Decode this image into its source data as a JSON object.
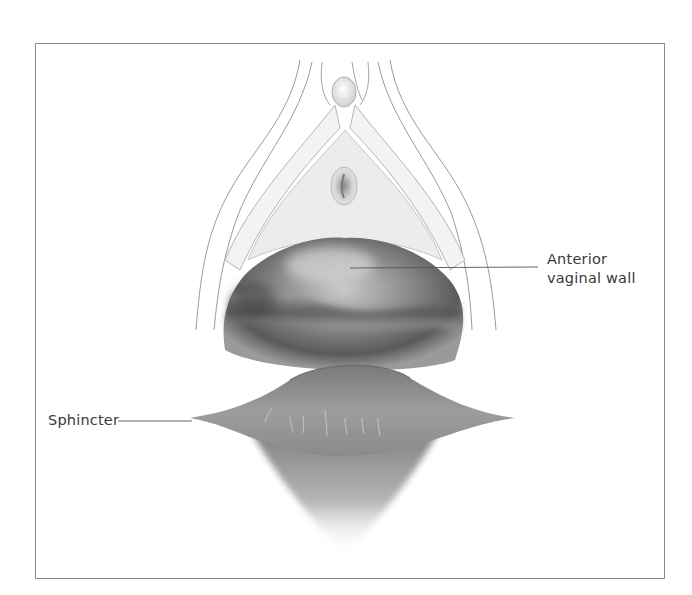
{
  "figure": {
    "type": "anatomical-illustration",
    "labels": {
      "anterior_line1": "Anterior",
      "anterior_line2": "vaginal wall",
      "sphincter": "Sphincter"
    },
    "colors": {
      "frame_border": "#8a8a8a",
      "label_text": "#3a3a3a",
      "leader_line": "#555555",
      "tissue_light": "#eeeeee",
      "tissue_dark": "#4a4a4a"
    }
  }
}
